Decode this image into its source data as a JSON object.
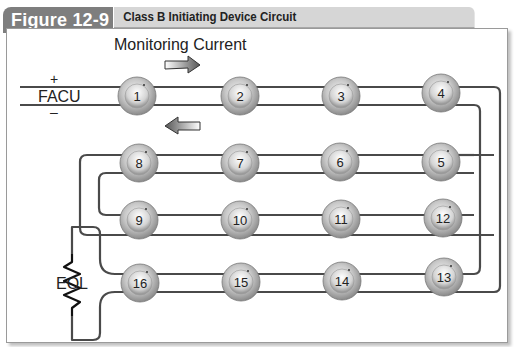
{
  "header": {
    "figure_label": "Figure 12-9",
    "title": "Class B Initiating Device Circuit"
  },
  "labels": {
    "monitoring_current": "Monitoring Current",
    "plus": "+",
    "minus": "–",
    "facu": "FACU",
    "eol": "EOL"
  },
  "devices": [
    {
      "id": "1"
    },
    {
      "id": "2"
    },
    {
      "id": "3"
    },
    {
      "id": "4"
    },
    {
      "id": "5"
    },
    {
      "id": "6"
    },
    {
      "id": "7"
    },
    {
      "id": "8"
    },
    {
      "id": "9"
    },
    {
      "id": "10"
    },
    {
      "id": "11"
    },
    {
      "id": "12"
    },
    {
      "id": "13"
    },
    {
      "id": "14"
    },
    {
      "id": "15"
    },
    {
      "id": "16"
    }
  ],
  "icons": {
    "forward_arrow": "arrow-right-icon",
    "return_arrow": "arrow-left-icon",
    "resistor": "resistor-icon"
  },
  "colors": {
    "tab": "#7e7e7e",
    "title_bar": "#d6d6d6",
    "wire": "#4a4a4a"
  }
}
